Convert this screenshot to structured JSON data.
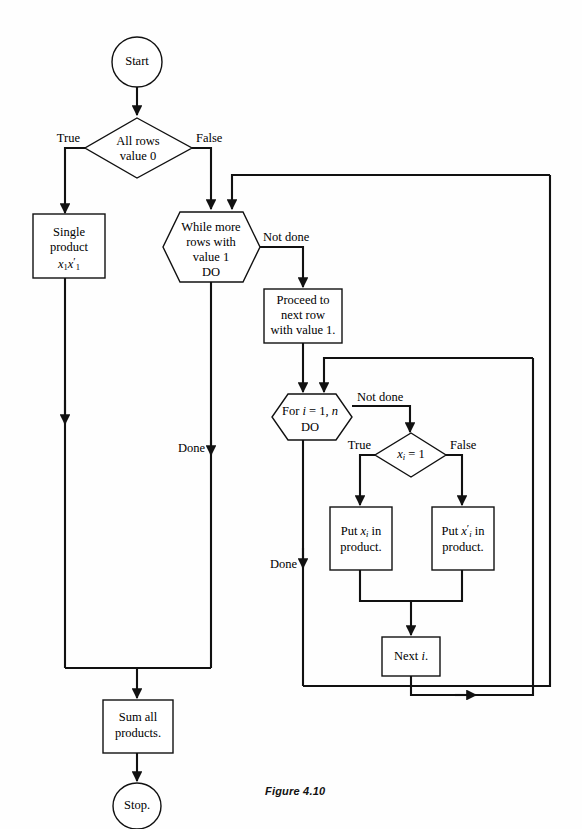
{
  "figure": {
    "caption": "Figure 4.10"
  },
  "nodes": {
    "start": {
      "label": "Start",
      "shape": "terminator-circle"
    },
    "all_rows_zero": {
      "label_line1": "All rows",
      "label_line2": "value 0",
      "shape": "decision-diamond"
    },
    "single_product": {
      "label_line1": "Single",
      "label_line2": "product",
      "label_line3_base": "x",
      "label_line3_sub": "1",
      "label_line3_base2": "x",
      "label_line3_sub2": "1",
      "label_line3_prime": "′",
      "shape": "process-box"
    },
    "while_more_rows": {
      "label_line1": "While more",
      "label_line2": "rows with",
      "label_line3": "value 1",
      "label_line4": "DO",
      "shape": "loop-hexagon"
    },
    "proceed_next_row": {
      "label_line1": "Proceed to",
      "label_line2": "next row",
      "label_line3": "with value 1.",
      "shape": "process-box"
    },
    "for_loop": {
      "label_prefix": "For ",
      "label_var": "i",
      "label_mid": " = 1, ",
      "label_n": "n",
      "label_line2": "DO",
      "shape": "loop-hexagon"
    },
    "xi_equals_1": {
      "label_var": "x",
      "label_sub": "i",
      "label_rest": " = 1",
      "shape": "decision-diamond"
    },
    "put_xi": {
      "label_prefix": "Put ",
      "label_var": "x",
      "label_sub": "i",
      "label_suffix": " in",
      "label_line2": "product.",
      "shape": "process-box"
    },
    "put_xi_prime": {
      "label_prefix": "Put ",
      "label_var": "x",
      "label_prime": "′",
      "label_sub": "i",
      "label_suffix": " in",
      "label_line2": "product.",
      "shape": "process-box"
    },
    "next_i": {
      "label_prefix": "Next ",
      "label_var": "i",
      "label_suffix": ".",
      "shape": "process-box"
    },
    "sum_all": {
      "label_line1": "Sum all",
      "label_line2": "products.",
      "shape": "process-box"
    },
    "stop": {
      "label": "Stop.",
      "shape": "terminator-circle"
    }
  },
  "edge_labels": {
    "true_left": "True",
    "false_right": "False",
    "while_not_done": "Not done",
    "while_done": "Done",
    "for_not_done": "Not done",
    "for_done": "Done",
    "xi_true": "True",
    "xi_false": "False"
  },
  "colors": {
    "stroke": "#111111",
    "fill": "#ffffff",
    "background": "#fefefe"
  }
}
